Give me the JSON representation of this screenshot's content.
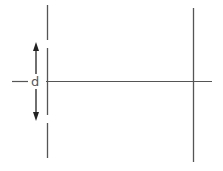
{
  "diagram": {
    "labels": {
      "slit_separation": "d"
    },
    "colors": {
      "line": "#555555",
      "arrow": "#222222",
      "background": "#ffffff"
    },
    "elements": [
      "barrier-with-two-slits",
      "screen",
      "central-axis",
      "separation-arrows"
    ]
  }
}
